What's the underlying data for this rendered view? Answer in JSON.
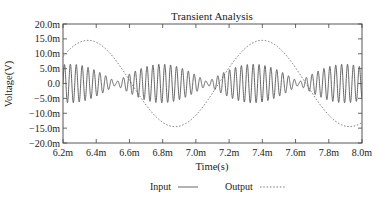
{
  "chart_data": {
    "type": "line",
    "title": "Transient Analysis",
    "xlabel": "Time(s)",
    "ylabel": "Voltage(V)",
    "xlim": [
      6.2,
      8.0
    ],
    "ylim": [
      -20.0,
      20.0
    ],
    "x_unit_suffix": "m",
    "y_unit_suffix": "m",
    "x_ticks": [
      "6.2m",
      "6.4m",
      "6.6m",
      "6.8m",
      "7.0m",
      "7.2m",
      "7.4m",
      "7.6m",
      "7.8m",
      "8.0m"
    ],
    "y_ticks": [
      "20.0m",
      "15.0m",
      "10.0m",
      "5.0m",
      "0.0",
      "-5.0m",
      "-10.0m",
      "-15.0m",
      "-20.0m"
    ],
    "grid": false,
    "legend_position": "bottom",
    "series": [
      {
        "name": "Input",
        "style": "solid",
        "description": "amplitude-modulated (beating) sinusoid, peak ~6.5m V, carrier period ~0.035 ms, envelope nulls near 6.52m, 7.07m, 7.62m s",
        "amplitude": 6.5,
        "carrier_period": 0.0355,
        "envelope_period": 1.1,
        "envelope_null_times": [
          6.52,
          7.07,
          7.62
        ],
        "envelope_peak_times": [
          6.25,
          6.79,
          7.34,
          7.89
        ]
      },
      {
        "name": "Output",
        "style": "dashed",
        "description": "slow sinusoid, amplitude ~14.5m V, period ~1.05 ms",
        "amplitude": 14.5,
        "period": 1.05,
        "peak_times": [
          6.35,
          7.37
        ],
        "trough_times": [
          6.87,
          7.88
        ],
        "points": [
          {
            "x": 6.2,
            "y": 9.0
          },
          {
            "x": 6.35,
            "y": 14.5
          },
          {
            "x": 6.6,
            "y": 3.0
          },
          {
            "x": 6.87,
            "y": -14.5
          },
          {
            "x": 7.1,
            "y": -5.0
          },
          {
            "x": 7.37,
            "y": 14.5
          },
          {
            "x": 7.6,
            "y": 5.0
          },
          {
            "x": 7.88,
            "y": -14.5
          },
          {
            "x": 8.0,
            "y": -11.0
          }
        ]
      }
    ]
  },
  "legend": {
    "input_label": "Input",
    "output_label": "Output"
  }
}
